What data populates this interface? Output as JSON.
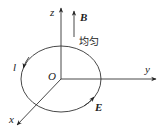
{
  "diagram": {
    "axes": {
      "z_label": "z",
      "y_label": "y",
      "x_label": "x",
      "origin_label": "O"
    },
    "field": {
      "label": "B",
      "annotation": "均匀"
    },
    "loop": {
      "label": "l"
    },
    "electric_field": {
      "label": "E"
    },
    "colors": {
      "stroke": "#333333",
      "text": "#222222"
    }
  }
}
